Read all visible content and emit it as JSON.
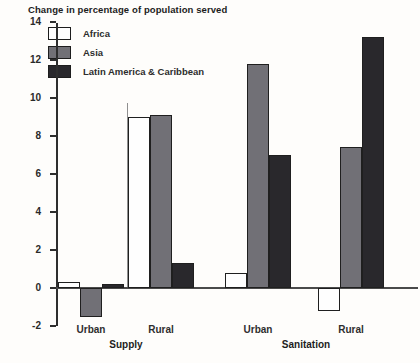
{
  "title": "Change in percentage of population served",
  "legend": [
    {
      "name": "Africa",
      "color": "#fefefe"
    },
    {
      "name": "Asia",
      "color": "#717076"
    },
    {
      "name": "Latin America & Caribbean",
      "color": "#29282c"
    }
  ],
  "chart_data": {
    "type": "bar",
    "title": "Change in percentage of population served",
    "categories": [
      "Urban",
      "Rural",
      "Urban",
      "Rural"
    ],
    "sections": [
      {
        "label": "Supply",
        "categories": [
          "Urban",
          "Rural"
        ]
      },
      {
        "label": "Sanitation",
        "categories": [
          "Urban",
          "Rural"
        ]
      }
    ],
    "series": [
      {
        "name": "Africa",
        "color": "#fefefe",
        "values": [
          0.3,
          9.0,
          0.8,
          -1.2
        ]
      },
      {
        "name": "Asia",
        "color": "#717076",
        "values": [
          -1.5,
          9.1,
          11.8,
          7.4
        ]
      },
      {
        "name": "Latin America & Caribbean",
        "color": "#29282c",
        "values": [
          0.2,
          1.3,
          7.0,
          13.2
        ]
      }
    ],
    "xlabel": "",
    "ylabel": "Change in percentage of population served",
    "ylim": [
      -2,
      14
    ],
    "yticks": [
      14,
      12,
      10,
      8,
      6,
      4,
      2,
      0,
      -2
    ],
    "grid": false,
    "legend_position": "top-left"
  }
}
